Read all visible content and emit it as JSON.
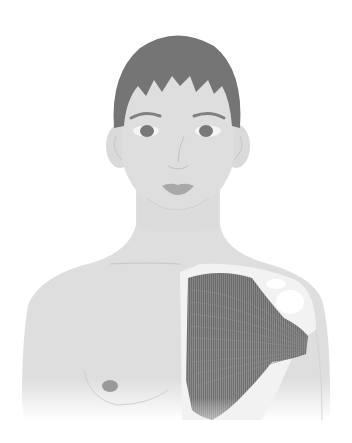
{
  "figure": {
    "subject": "pectoralis major muscle anatomy illustration",
    "colors": {
      "background": "#ffffff",
      "skin": "#dedede",
      "hair": "#757575",
      "features": "#7a7a7a",
      "lips": "#a8a8a8",
      "nipple": "#9a9a9a",
      "muscle": "#6e6e6e",
      "muscle_fiber": "#8c8c8c",
      "bone": "#f2f2f2"
    }
  }
}
